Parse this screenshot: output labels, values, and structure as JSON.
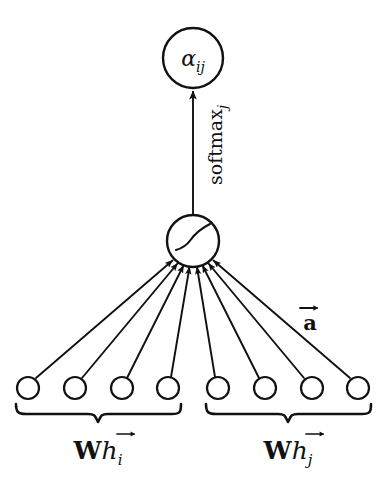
{
  "figure": {
    "kind": "graph-attention-mechanism-diagram",
    "background_color": "#ffffff",
    "stroke_color": "#111111"
  },
  "output_node": {
    "label_alpha": "α",
    "label_subscript": "ij",
    "center_x": 193,
    "center_y": 58,
    "radius": 30
  },
  "softmax_edge": {
    "label_main": "softmax",
    "label_subscript": "j",
    "rotation_deg": -90,
    "from_x": 193,
    "from_y": 215,
    "to_x": 193,
    "to_y": 90
  },
  "hub_node": {
    "center_x": 193,
    "center_y": 241,
    "radius": 26,
    "activation_name": "leaky-relu-curve"
  },
  "attention_vector": {
    "label_letter": "a",
    "accent": "vector-arrow",
    "x": 310,
    "y": 322
  },
  "input_nodes": {
    "radius": 11,
    "center_y": 388,
    "left_group_x": [
      28,
      75,
      122,
      168
    ],
    "right_group_x": [
      218,
      265,
      312,
      358
    ]
  },
  "braces": [
    {
      "name": "left-brace",
      "label_matrix": "W",
      "label_vector": "h",
      "label_subscript": "i",
      "x_start": 14,
      "x_end": 182,
      "y": 404,
      "label_x": 98,
      "label_y": 452
    },
    {
      "name": "right-brace",
      "label_matrix": "W",
      "label_vector": "h",
      "label_subscript": "j",
      "x_start": 204,
      "x_end": 372,
      "y": 404,
      "label_x": 288,
      "label_y": 452
    }
  ]
}
